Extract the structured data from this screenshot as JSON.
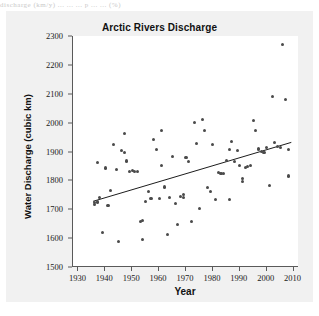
{
  "page": {
    "scan_artifact_text": "discharge (km/y)      ...   ...   ... p ...  ... (%)"
  },
  "chart_data": {
    "type": "scatter",
    "title": "Arctic Rivers Discharge",
    "xlabel": "Year",
    "ylabel": "Water Discharge (cubic km)",
    "xlim": [
      1928,
      2012
    ],
    "ylim": [
      1500,
      2300
    ],
    "xticks": [
      1930,
      1940,
      1950,
      1960,
      1970,
      1980,
      1990,
      2000,
      2010
    ],
    "yticks": [
      1500,
      1600,
      1700,
      1800,
      1900,
      2000,
      2100,
      2200,
      2300
    ],
    "grid": false,
    "legend": null,
    "marker_color": "#4a4a4a",
    "trendline_color": "#1a1a1a",
    "plot_background": "#ffffff",
    "figure_background": "#f1f1f1",
    "series": [
      {
        "name": "Annual water discharge",
        "points": [
          [
            1936,
            1723
          ],
          [
            1936,
            1718
          ],
          [
            1937,
            1725
          ],
          [
            1937,
            1863
          ],
          [
            1938,
            1742
          ],
          [
            1939,
            1618
          ],
          [
            1940,
            1843
          ],
          [
            1941,
            1712
          ],
          [
            1942,
            1765
          ],
          [
            1943,
            1923
          ],
          [
            1944,
            1838
          ],
          [
            1945,
            1589
          ],
          [
            1946,
            1902
          ],
          [
            1947,
            1897
          ],
          [
            1947,
            1962
          ],
          [
            1948,
            1867
          ],
          [
            1949,
            1831
          ],
          [
            1950,
            1833
          ],
          [
            1951,
            1832
          ],
          [
            1952,
            1832
          ],
          [
            1953,
            1658
          ],
          [
            1954,
            1595
          ],
          [
            1954,
            1661
          ],
          [
            1955,
            1726
          ],
          [
            1956,
            1763
          ],
          [
            1957,
            1737
          ],
          [
            1958,
            1940
          ],
          [
            1959,
            1908
          ],
          [
            1960,
            1738
          ],
          [
            1961,
            1852
          ],
          [
            1961,
            1973
          ],
          [
            1962,
            1777
          ],
          [
            1963,
            1611
          ],
          [
            1964,
            1740
          ],
          [
            1965,
            1884
          ],
          [
            1966,
            1720
          ],
          [
            1967,
            1648
          ],
          [
            1968,
            1744
          ],
          [
            1969,
            1750
          ],
          [
            1969,
            1742
          ],
          [
            1970,
            1878
          ],
          [
            1971,
            1866
          ],
          [
            1972,
            1659
          ],
          [
            1973,
            2002
          ],
          [
            1974,
            1929
          ],
          [
            1975,
            1703
          ],
          [
            1976,
            2011
          ],
          [
            1977,
            1973
          ],
          [
            1978,
            1775
          ],
          [
            1979,
            1762
          ],
          [
            1980,
            1923
          ],
          [
            1981,
            1735
          ],
          [
            1982,
            1826
          ],
          [
            1983,
            1823
          ],
          [
            1984,
            1823
          ],
          [
            1985,
            1869
          ],
          [
            1986,
            1908
          ],
          [
            1986,
            1735
          ],
          [
            1987,
            1935
          ],
          [
            1988,
            1864
          ],
          [
            1989,
            1902
          ],
          [
            1990,
            1851
          ],
          [
            1991,
            1806
          ],
          [
            1991,
            1795
          ],
          [
            1992,
            1846
          ],
          [
            1993,
            1848
          ],
          [
            1994,
            1852
          ],
          [
            1995,
            2008
          ],
          [
            1996,
            1974
          ],
          [
            1997,
            1906
          ],
          [
            1997,
            1911
          ],
          [
            1998,
            1900
          ],
          [
            1999,
            1896
          ],
          [
            2000,
            1914
          ],
          [
            2001,
            1782
          ],
          [
            2002,
            2089
          ],
          [
            2003,
            1932
          ],
          [
            2004,
            1918
          ],
          [
            2005,
            1914
          ],
          [
            2006,
            2272
          ],
          [
            2007,
            2081
          ],
          [
            2008,
            1906
          ],
          [
            2008,
            1815
          ]
        ]
      }
    ],
    "trendline": {
      "label": "linear trend",
      "x_start": 1935.5,
      "y_start": 1725,
      "x_end": 2009.5,
      "y_end": 1930
    }
  }
}
